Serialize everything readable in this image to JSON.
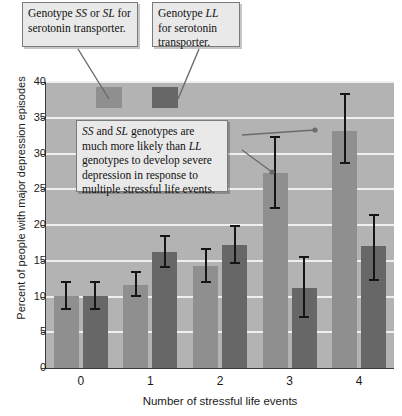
{
  "chart_data": {
    "type": "bar",
    "title": "",
    "subtitle": "",
    "xlabel": "Number of stressful life events",
    "ylabel": "Percent of people with major depression episodes",
    "categories": [
      "0",
      "1",
      "2",
      "3",
      "4"
    ],
    "ylim": [
      0,
      40
    ],
    "yticks": [
      0,
      5,
      10,
      15,
      20,
      25,
      30,
      35,
      40
    ],
    "grid": true,
    "legend_position": "top-inside",
    "series": [
      {
        "name": "Genotype SS or SL for serotonin transporter",
        "color": "#8f8f8f",
        "values": [
          10.1,
          11.6,
          14.3,
          27.3,
          33.2
        ],
        "err_low": [
          8.1,
          9.9,
          11.9,
          22.2,
          28.5
        ],
        "err_high": [
          12.2,
          13.6,
          16.8,
          32.5,
          38.5
        ]
      },
      {
        "name": "Genotype LL for serotonin transporter",
        "color": "#676767",
        "values": [
          10.1,
          16.2,
          17.2,
          11.2,
          17.0
        ],
        "err_low": [
          8.1,
          14.0,
          14.6,
          7.0,
          12.2
        ],
        "err_high": [
          12.2,
          18.6,
          20.0,
          15.6,
          21.5
        ]
      }
    ],
    "annotations": [
      {
        "id": "callout-ss-sl",
        "text": "Genotype SS or SL for serotonin transporter.",
        "segments": [
          {
            "text": "Genotype ",
            "italic": false
          },
          {
            "text": "SS",
            "italic": true
          },
          {
            "text": " or ",
            "italic": false
          },
          {
            "text": "SL",
            "italic": true
          },
          {
            "text": " for serotonin transporter.",
            "italic": false
          }
        ]
      },
      {
        "id": "callout-ll",
        "text": "Genotype LL for serotonin transporter.",
        "segments": [
          {
            "text": "Genotype ",
            "italic": false
          },
          {
            "text": "LL",
            "italic": true
          },
          {
            "text": " for serotonin transporter.",
            "italic": false
          }
        ]
      },
      {
        "id": "callout-finding",
        "text": "SS and SL genotypes are much more likely than LL genotypes to develop severe depression in response to multiple stressful life events.",
        "segments": [
          {
            "text": "SS",
            "italic": true
          },
          {
            "text": " and ",
            "italic": false
          },
          {
            "text": "SL",
            "italic": true
          },
          {
            "text": " genotypes are much more likely than ",
            "italic": false
          },
          {
            "text": "LL",
            "italic": true
          },
          {
            "text": " genotypes to develop severe depression in response to multiple stressful life events.",
            "italic": false
          }
        ]
      }
    ]
  },
  "colors": {
    "plot_background": "#b3b3b3",
    "gridline": "#efefef",
    "axis": "#3a3a3a",
    "series_light": "#8f8f8f",
    "series_dark": "#676767",
    "error_bar": "#151515",
    "callout_background": "#e9e9e9",
    "callout_border": "#7b7b7b",
    "leader_line": "#6b6b6b"
  }
}
